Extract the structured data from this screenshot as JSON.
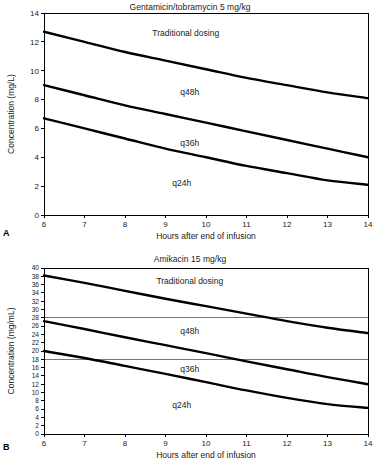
{
  "figure": {
    "panels": [
      {
        "letter": "A",
        "title": "Gentamicin/tobramycin 5 mg/kg",
        "chart_data": {
          "type": "line",
          "title": "Gentamicin/tobramycin 5 mg/kg",
          "xlabel": "Hours after end of infusion",
          "ylabel": "Concentration (mg/L)",
          "xlim": [
            6,
            14
          ],
          "ylim": [
            0,
            14
          ],
          "xticks": [
            6,
            7,
            8,
            9,
            10,
            11,
            12,
            13,
            14
          ],
          "yticks": [
            0,
            2,
            4,
            6,
            8,
            10,
            12,
            14
          ],
          "grid": false,
          "legend": "inline-annotations",
          "x": [
            6,
            7,
            8,
            9,
            10,
            11,
            12,
            13,
            14
          ],
          "series": [
            {
              "name": "Traditional dosing",
              "values": [
                12.7,
                12.0,
                11.3,
                10.7,
                10.1,
                9.5,
                9.0,
                8.5,
                8.1
              ]
            },
            {
              "name": "q48h",
              "values": [
                9.0,
                8.3,
                7.6,
                7.0,
                6.4,
                5.8,
                5.2,
                4.6,
                4.0
              ]
            },
            {
              "name": "q24h",
              "values": [
                6.7,
                6.0,
                5.3,
                4.6,
                4.0,
                3.4,
                2.9,
                2.4,
                2.1
              ]
            }
          ],
          "annotations": [
            {
              "text": "Traditional dosing",
              "x": 9.5,
              "y": 12.4
            },
            {
              "text": "q48h",
              "x": 9.6,
              "y": 8.3
            },
            {
              "text": "q36h",
              "x": 9.6,
              "y": 4.8
            },
            {
              "text": "q24h",
              "x": 9.4,
              "y": 2.0
            }
          ],
          "reference_lines": []
        }
      },
      {
        "letter": "B",
        "title": "Amikacin 15 mg/kg",
        "chart_data": {
          "type": "line",
          "title": "Amikacin 15 mg/kg",
          "xlabel": "Hours after end of infusion",
          "ylabel": "Concentration (mg/mL)",
          "xlim": [
            6,
            14
          ],
          "ylim": [
            0,
            40
          ],
          "xticks": [
            6,
            7,
            8,
            9,
            10,
            11,
            12,
            13,
            14
          ],
          "yticks": [
            0,
            2,
            4,
            6,
            8,
            10,
            12,
            14,
            16,
            18,
            20,
            22,
            24,
            26,
            28,
            30,
            32,
            34,
            36,
            38,
            40
          ],
          "grid": false,
          "legend": "inline-annotations",
          "x": [
            6,
            7,
            8,
            9,
            10,
            11,
            12,
            13,
            14
          ],
          "series": [
            {
              "name": "Traditional dosing",
              "values": [
                38.2,
                36.4,
                34.5,
                32.6,
                30.8,
                29.0,
                27.2,
                25.6,
                24.3
              ]
            },
            {
              "name": "q48h",
              "values": [
                27.2,
                25.3,
                23.3,
                21.4,
                19.5,
                17.5,
                15.6,
                13.7,
                12.0
              ]
            },
            {
              "name": "q24h",
              "values": [
                20.0,
                18.3,
                16.4,
                14.5,
                12.5,
                10.5,
                8.7,
                7.2,
                6.3
              ]
            }
          ],
          "annotations": [
            {
              "text": "Traditional dosing",
              "x": 9.6,
              "y": 36.2
            },
            {
              "text": "q48h",
              "x": 9.6,
              "y": 24.0
            },
            {
              "text": "q36h",
              "x": 9.6,
              "y": 15.0
            },
            {
              "text": "q24h",
              "x": 9.4,
              "y": 6.3
            }
          ],
          "reference_lines": [
            {
              "y": 28,
              "orientation": "horizontal"
            },
            {
              "y": 18,
              "orientation": "horizontal"
            }
          ]
        }
      }
    ]
  },
  "colors": {
    "curve": "#000000",
    "frame": "#000000",
    "refline": "#555555",
    "background": "#ffffff",
    "text": "#1a1a1a"
  }
}
